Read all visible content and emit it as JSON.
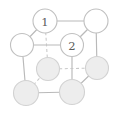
{
  "figure": {
    "kind": "crystal-unit-cell",
    "width": 121,
    "height": 117,
    "background": "#ffffff",
    "edge_color": "#b9b9b9",
    "hidden_edge_color": "#c8c8c8",
    "node_open_fill": "#ffffff",
    "node_filled_fill": "#ededed",
    "node_stroke": "#c0c0c0",
    "label_color": "#5c5c5c"
  },
  "nodes": [
    {
      "id": "top-back-left",
      "label": "",
      "cx": 22,
      "cy": 45,
      "r": 11.5,
      "style": "open",
      "visible_label": false
    },
    {
      "id": "top-front-left",
      "label": "1",
      "cx": 45,
      "cy": 21,
      "r": 12.0,
      "style": "open",
      "visible_label": true
    },
    {
      "id": "top-back-right",
      "label": "2",
      "cx": 72,
      "cy": 45,
      "r": 11.5,
      "style": "open",
      "visible_label": true
    },
    {
      "id": "top-front-right",
      "label": "",
      "cx": 96,
      "cy": 21,
      "r": 12.0,
      "style": "open",
      "visible_label": false
    },
    {
      "id": "bottom-back-left",
      "label": "",
      "cx": 48,
      "cy": 69,
      "r": 11.5,
      "style": "filled",
      "visible_label": false
    },
    {
      "id": "bottom-back-right",
      "label": "",
      "cx": 97,
      "cy": 68,
      "r": 11.5,
      "style": "filled",
      "visible_label": false
    },
    {
      "id": "bottom-front-left",
      "label": "",
      "cx": 26,
      "cy": 93,
      "r": 12.5,
      "style": "filled",
      "visible_label": false
    },
    {
      "id": "bottom-front-right",
      "label": "",
      "cx": 72,
      "cy": 92,
      "r": 12.5,
      "style": "filled",
      "visible_label": false
    }
  ],
  "edges": [
    {
      "id": "top-front-left--top-front-right",
      "x1": 45,
      "y1": 21,
      "x2": 96,
      "y2": 21,
      "hidden": false
    },
    {
      "id": "top-front-left--top-back-left",
      "x1": 45,
      "y1": 21,
      "x2": 22,
      "y2": 45,
      "hidden": false
    },
    {
      "id": "top-front-right--top-back-right",
      "x1": 96,
      "y1": 21,
      "x2": 72,
      "y2": 45,
      "hidden": false
    },
    {
      "id": "top-back-left--top-back-right",
      "x1": 22,
      "y1": 45,
      "x2": 72,
      "y2": 45,
      "hidden": false
    },
    {
      "id": "top-back-left--bottom-back-left",
      "x1": 22,
      "y1": 45,
      "x2": 26,
      "y2": 93,
      "hidden": false
    },
    {
      "id": "top-front-left--bottom-front-left",
      "x1": 45,
      "y1": 21,
      "x2": 48,
      "y2": 69,
      "hidden": true
    },
    {
      "id": "top-back-right--bottom-back-right",
      "x1": 72,
      "y1": 45,
      "x2": 72,
      "y2": 92,
      "hidden": false
    },
    {
      "id": "top-front-right--bottom-front-right",
      "x1": 96,
      "y1": 21,
      "x2": 97,
      "y2": 68,
      "hidden": false
    },
    {
      "id": "bottom-front-left--bottom-back-left",
      "x1": 26,
      "y1": 93,
      "x2": 48,
      "y2": 69,
      "hidden": true
    },
    {
      "id": "bottom-back-left--bottom-back-right",
      "x1": 48,
      "y1": 69,
      "x2": 97,
      "y2": 68,
      "hidden": true
    },
    {
      "id": "bottom-front-left--bottom-front-right",
      "x1": 26,
      "y1": 93,
      "x2": 72,
      "y2": 92,
      "hidden": false
    },
    {
      "id": "bottom-front-right--bottom-back-right",
      "x1": 72,
      "y1": 92,
      "x2": 97,
      "y2": 68,
      "hidden": false
    }
  ],
  "labels": {
    "site_1": "1",
    "site_2": "2"
  }
}
